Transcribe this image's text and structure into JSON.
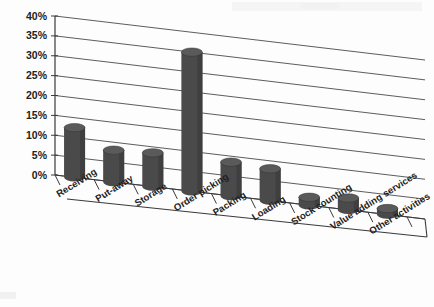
{
  "chart_data": {
    "type": "bar",
    "title": "",
    "subtitle": "",
    "xlabel": "",
    "ylabel": "",
    "ylim": [
      0,
      40
    ],
    "ytick_labels": [
      "0%",
      "5%",
      "10%",
      "15%",
      "20%",
      "25%",
      "30%",
      "35%",
      "40%"
    ],
    "ytick_values": [
      0,
      5,
      10,
      15,
      20,
      25,
      30,
      35,
      40
    ],
    "grid": true,
    "legend": "none",
    "projection": "3d-cylinder",
    "series_color": "#4a4a4a",
    "categories": [
      "Receiving",
      "Put-away",
      "Storage",
      "Order picking",
      "Packing",
      "Loading",
      "Stock counting",
      "Value adding services",
      "Other activities"
    ],
    "values": [
      12.5,
      8,
      8.5,
      35,
      8.5,
      8,
      2,
      3,
      1.5
    ],
    "series": [
      {
        "name": "Share of time",
        "values": [
          12.5,
          8,
          8.5,
          35,
          8.5,
          8,
          2,
          3,
          1.5
        ]
      }
    ]
  }
}
